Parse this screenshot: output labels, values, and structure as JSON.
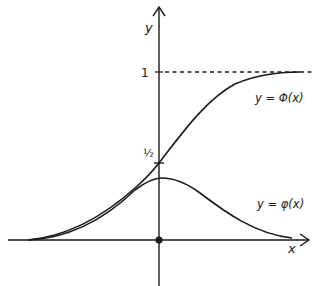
{
  "diagram": {
    "axes": {
      "x_label": "x",
      "y_label": "y"
    },
    "ticks": {
      "one_label": "1",
      "half_label": "½"
    },
    "curves": [
      {
        "id": "cdf",
        "label": "y = Φ(x)",
        "description": "cumulative distribution function, sigmoid from 0 to 1 passing through ½ at x = 0"
      },
      {
        "id": "pdf",
        "label": "y = φ(x)",
        "description": "probability density function, bell curve peaking at x = 0"
      }
    ],
    "asymptote": {
      "y": 1,
      "style": "dashed"
    },
    "origin_marker": "filled-dot",
    "colors": {
      "ink": "#1a1a1a",
      "background": "#ffffff"
    }
  }
}
